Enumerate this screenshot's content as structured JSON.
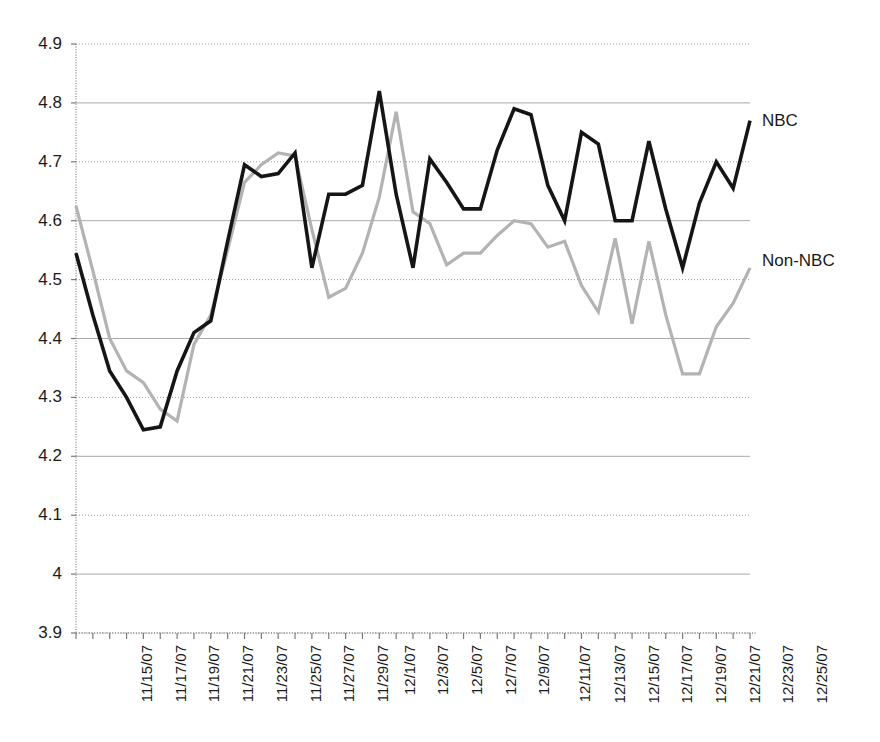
{
  "chart_data": {
    "type": "line",
    "title": "",
    "subtitle": "",
    "xlabel": "",
    "ylabel": "",
    "grid": true,
    "legend_position": "right-inline",
    "ylim": [
      3.9,
      4.9
    ],
    "y_ticks": [
      "3.9",
      "4",
      "4.1",
      "4.2",
      "4.3",
      "4.4",
      "4.5",
      "4.6",
      "4.7",
      "4.8",
      "4.9"
    ],
    "y_tick_values": [
      3.9,
      4.0,
      4.1,
      4.2,
      4.3,
      4.4,
      4.5,
      4.6,
      4.7,
      4.8,
      4.9
    ],
    "x": [
      "11/15/07",
      "11/16/07",
      "11/17/07",
      "11/18/07",
      "11/19/07",
      "11/20/07",
      "11/21/07",
      "11/22/07",
      "11/23/07",
      "11/24/07",
      "11/25/07",
      "11/26/07",
      "11/27/07",
      "11/28/07",
      "11/29/07",
      "11/30/07",
      "12/1/07",
      "12/2/07",
      "12/3/07",
      "12/4/07",
      "12/5/07",
      "12/6/07",
      "12/7/07",
      "12/8/07",
      "12/9/07",
      "12/10/07",
      "12/11/07",
      "12/12/07",
      "12/13/07",
      "12/14/07",
      "12/15/07",
      "12/16/07",
      "12/17/07",
      "12/18/07",
      "12/19/07",
      "12/20/07",
      "12/21/07",
      "12/22/07",
      "12/23/07",
      "12/24/07",
      "12/25/07"
    ],
    "x_tick_labels": [
      "11/15/07",
      "",
      "11/17/07",
      "",
      "11/19/07",
      "",
      "11/21/07",
      "",
      "11/23/07",
      "",
      "11/25/07",
      "",
      "11/27/07",
      "",
      "11/29/07",
      "",
      "12/1/07",
      "",
      "12/3/07",
      "",
      "12/5/07",
      "",
      "12/7/07",
      "",
      "12/9/07",
      "",
      "12/11/07",
      "",
      "12/13/07",
      "",
      "12/15/07",
      "",
      "12/17/07",
      "",
      "12/19/07",
      "",
      "12/21/07",
      "",
      "12/23/07",
      "",
      "12/25/07"
    ],
    "series": [
      {
        "name": "NBC",
        "color": "#151515",
        "width": 3.6,
        "values": [
          4.545,
          4.44,
          4.345,
          4.3,
          4.245,
          4.25,
          4.345,
          4.41,
          4.43,
          4.565,
          4.695,
          4.675,
          4.68,
          4.715,
          4.52,
          4.645,
          4.645,
          4.66,
          4.82,
          4.645,
          4.52,
          4.705,
          4.665,
          4.62,
          4.62,
          4.72,
          4.79,
          4.78,
          4.66,
          4.6,
          4.75,
          4.73,
          4.6,
          4.6,
          4.735,
          4.62,
          4.52,
          4.63,
          4.7,
          4.655,
          4.77
        ]
      },
      {
        "name": "Non-NBC",
        "color": "#b3b3b3",
        "width": 3.2,
        "values": [
          4.625,
          4.515,
          4.4,
          4.345,
          4.325,
          4.28,
          4.26,
          4.39,
          4.44,
          4.55,
          4.665,
          4.695,
          4.715,
          4.71,
          4.585,
          4.47,
          4.485,
          4.545,
          4.64,
          4.785,
          4.615,
          4.595,
          4.525,
          4.545,
          4.545,
          4.575,
          4.6,
          4.595,
          4.555,
          4.565,
          4.49,
          4.445,
          4.57,
          4.425,
          4.565,
          4.44,
          4.34,
          4.34,
          4.42,
          4.46,
          4.52
        ]
      }
    ]
  },
  "annotations": {
    "nbc_label": "NBC",
    "non_nbc_label": "Non-NBC"
  },
  "axis_geometry": {
    "plot_left": 76,
    "plot_right": 750,
    "plot_top": 44,
    "plot_bottom": 633
  }
}
